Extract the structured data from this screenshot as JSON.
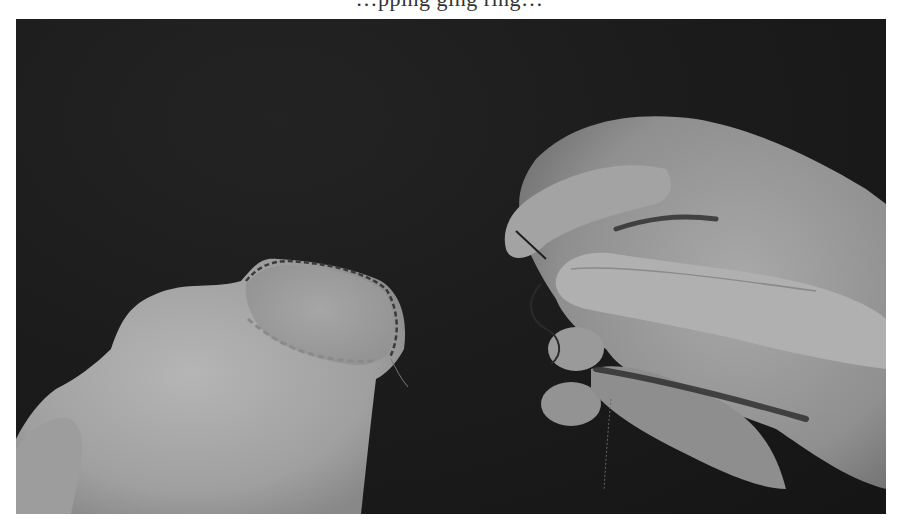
{
  "page": {
    "clipped_caption_fragment": "…pping ging  ring…"
  },
  "photo": {
    "description": "Black-and-white photo of a hand holding a needle and dark thread, sewing the rim of a light fabric piece (whipstitched edge) against a dark background",
    "tone": "grayscale",
    "colors": {
      "background": "#1c1c1c",
      "fabric": "#a8a8a8",
      "fabric_highlight": "#bdbdbd",
      "hand": "#9a9a9a",
      "hand_shadow": "#6e6e6e",
      "thread": "#2a2a2a"
    },
    "subjects": [
      "fabric-piece",
      "stitched-rim",
      "hand",
      "needle",
      "thread"
    ]
  }
}
